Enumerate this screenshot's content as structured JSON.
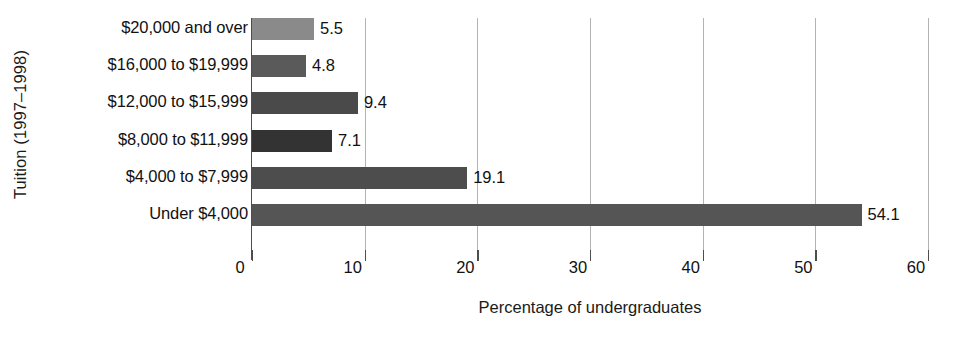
{
  "chart_data": {
    "type": "bar",
    "orientation": "horizontal",
    "title": "",
    "xlabel": "Percentage of undergraduates",
    "ylabel": "Tuition (1997–1998)",
    "categories": [
      "$20,000 and over",
      "$16,000 to $19,999",
      "$12,000 to $15,999",
      "$8,000 to $11,999",
      "$4,000 to $7,999",
      "Under $4,000"
    ],
    "values": [
      5.5,
      4.8,
      9.4,
      7.1,
      19.1,
      54.1
    ],
    "value_labels": [
      "5.5",
      "4.8",
      "9.4",
      "7.1",
      "19.1",
      "54.1"
    ],
    "bar_colors": [
      "#8a8a8a",
      "#5a5a5a",
      "#4a4a4a",
      "#333333",
      "#4d4d4d",
      "#555555"
    ],
    "xlim": [
      0,
      60
    ],
    "xticks": [
      0,
      10,
      20,
      30,
      40,
      50,
      60
    ],
    "xtick_labels": [
      "0",
      "10",
      "20",
      "30",
      "40",
      "50",
      "60"
    ],
    "grid": "vertical-only",
    "gridline_color": "#b3b3b3",
    "axis_color": "#4d4d4d",
    "legend": "none",
    "background": "#ffffff"
  }
}
